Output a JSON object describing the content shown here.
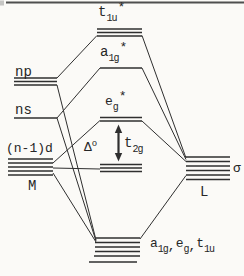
{
  "figure": {
    "background": "#fbfaf7",
    "ink": "#2f2f2f",
    "top_rule_color": "#4f4f4f"
  },
  "labels": {
    "np": "np",
    "ns": "ns",
    "nd": "(n-1)d",
    "metal": "M",
    "ligand": "L",
    "sigma": "σ",
    "t1u_star": {
      "base": "t",
      "sub": "1u",
      "sup": "*"
    },
    "a1g_star": {
      "base": "a",
      "sub": "1g",
      "sup": "*"
    },
    "eg_star": {
      "base": "e",
      "sub": "g",
      "sup": "*"
    },
    "delta": {
      "base": "Δ",
      "sup": "o"
    },
    "t2g": {
      "base": "t",
      "sub": "2g"
    },
    "bonding": {
      "p1": {
        "base": "a",
        "sub": "1g"
      },
      "comma1": ",",
      "p2": {
        "base": "e",
        "sub": "g"
      },
      "comma2": ",",
      "p3": {
        "base": "t",
        "sub": "1u"
      }
    }
  },
  "levels": [
    {
      "name": "t1u-star",
      "lines": [
        [
          97,
          29,
          142
        ],
        [
          97,
          32.5,
          142
        ],
        [
          97,
          36,
          142
        ]
      ]
    },
    {
      "name": "a1g-star",
      "lines": [
        [
          100,
          68,
          142
        ]
      ]
    },
    {
      "name": "np",
      "lines": [
        [
          14,
          78,
          57
        ],
        [
          14,
          81.5,
          57
        ],
        [
          14,
          85,
          57
        ]
      ]
    },
    {
      "name": "ns",
      "lines": [
        [
          14,
          118,
          57
        ]
      ]
    },
    {
      "name": "eg-star",
      "lines": [
        [
          100,
          117.5,
          142
        ],
        [
          100,
          121,
          142
        ]
      ]
    },
    {
      "name": "n-1-d",
      "lines": [
        [
          8,
          159,
          53
        ],
        [
          8,
          163,
          53
        ],
        [
          8,
          167,
          53
        ],
        [
          8,
          171,
          53
        ],
        [
          8,
          175,
          53
        ]
      ]
    },
    {
      "name": "t2g",
      "lines": [
        [
          100,
          164.5,
          142
        ],
        [
          100,
          168,
          142
        ],
        [
          100,
          171.5,
          142
        ]
      ]
    },
    {
      "name": "ligand-sigma",
      "lines": [
        [
          186,
          157,
          230
        ],
        [
          186,
          161.5,
          230
        ],
        [
          186,
          166,
          230
        ],
        [
          186,
          170.5,
          230
        ],
        [
          186,
          175,
          230
        ],
        [
          186,
          179.5,
          230
        ]
      ]
    },
    {
      "name": "bonding",
      "lines": [
        [
          96,
          238,
          140
        ],
        [
          95,
          242.5,
          140
        ],
        [
          95,
          247,
          140
        ],
        [
          95,
          251.5,
          140
        ],
        [
          94,
          256,
          140
        ],
        [
          89,
          262,
          137
        ]
      ]
    }
  ],
  "connectors": [
    {
      "name": "np-to-t1u-star",
      "x1": 57,
      "y1": 78,
      "x2": 97,
      "y2": 35.5
    },
    {
      "name": "np-to-bonding",
      "x1": 57,
      "y1": 85,
      "x2": 96,
      "y2": 240
    },
    {
      "name": "ns-to-a1g-star",
      "x1": 57,
      "y1": 118,
      "x2": 100,
      "y2": 68
    },
    {
      "name": "ns-to-bonding",
      "x1": 57,
      "y1": 118,
      "x2": 96,
      "y2": 241
    },
    {
      "name": "d-to-eg-star",
      "x1": 53,
      "y1": 163,
      "x2": 100,
      "y2": 120.5
    },
    {
      "name": "d-to-t2g",
      "x1": 53,
      "y1": 168,
      "x2": 100,
      "y2": 169
    },
    {
      "name": "d-to-bonding",
      "x1": 53,
      "y1": 173,
      "x2": 96,
      "y2": 242
    },
    {
      "name": "t1u-star-to-ligand",
      "x1": 142,
      "y1": 35.5,
      "x2": 186,
      "y2": 158
    },
    {
      "name": "a1g-star-to-ligand",
      "x1": 142,
      "y1": 68,
      "x2": 186,
      "y2": 159.5
    },
    {
      "name": "eg-star-to-ligand",
      "x1": 142,
      "y1": 121,
      "x2": 186,
      "y2": 161.5
    },
    {
      "name": "ligand-to-bonding",
      "x1": 186,
      "y1": 175.5,
      "x2": 140,
      "y2": 239
    }
  ],
  "arrow": {
    "x": 118.5,
    "tip_top": 124.5,
    "tip_bottom": 161.5,
    "head_w": 7.4,
    "head_h": 8.5
  }
}
